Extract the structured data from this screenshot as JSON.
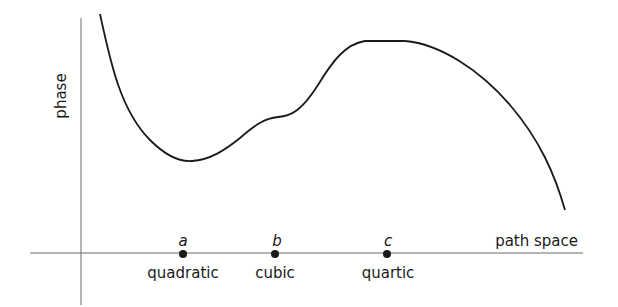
{
  "diagram": {
    "y_axis_label": "phase",
    "x_axis_label": "path space",
    "points": [
      {
        "letter": "a",
        "label": "quadratic"
      },
      {
        "letter": "b",
        "label": "cubic"
      },
      {
        "letter": "c",
        "label": "quartic"
      }
    ],
    "colors": {
      "curve": "#1a1a1a",
      "axis": "#6a6a6a",
      "background": "#ffffff"
    }
  }
}
